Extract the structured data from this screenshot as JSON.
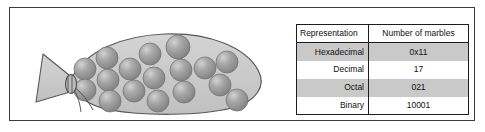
{
  "figure": {
    "caption_present": false
  },
  "illustration": {
    "name": "bag-of-marbles",
    "marble_count": 17,
    "bag_fill": "#c6c6c6",
    "bag_outline": "#58585a",
    "marble_fill": "#9a9a9a",
    "marble_highlight": "#cfcfcf",
    "marble_outline": "#6e6e70",
    "marbles": [
      {
        "cx": 61,
        "cy": 47,
        "r": 11
      },
      {
        "cx": 61,
        "cy": 68,
        "r": 11
      },
      {
        "cx": 83,
        "cy": 36,
        "r": 11
      },
      {
        "cx": 84,
        "cy": 58,
        "r": 11
      },
      {
        "cx": 86,
        "cy": 79,
        "r": 11
      },
      {
        "cx": 106,
        "cy": 47,
        "r": 11
      },
      {
        "cx": 110,
        "cy": 69,
        "r": 11
      },
      {
        "cx": 126,
        "cy": 32,
        "r": 11
      },
      {
        "cx": 130,
        "cy": 56,
        "r": 11
      },
      {
        "cx": 134,
        "cy": 79,
        "r": 11
      },
      {
        "cx": 154,
        "cy": 25,
        "r": 12
      },
      {
        "cx": 157,
        "cy": 48,
        "r": 11
      },
      {
        "cx": 160,
        "cy": 70,
        "r": 11
      },
      {
        "cx": 181,
        "cy": 46,
        "r": 11
      },
      {
        "cx": 196,
        "cy": 63,
        "r": 11
      },
      {
        "cx": 203,
        "cy": 40,
        "r": 11
      },
      {
        "cx": 213,
        "cy": 78,
        "r": 11
      }
    ]
  },
  "table": {
    "name": "number-representation-table",
    "headers": {
      "representation": "Representation",
      "value": "Number of marbles"
    },
    "rows": [
      {
        "representation": "Hexadecimal",
        "value": "0x11",
        "shaded": true
      },
      {
        "representation": "Decimal",
        "value": "17",
        "shaded": false
      },
      {
        "representation": "Octal",
        "value": "021",
        "shaded": true
      },
      {
        "representation": "Binary",
        "value": "10001",
        "shaded": false
      }
    ],
    "shaded_row_color": "#c9c9c9",
    "border_color": "#1d1d1d"
  }
}
